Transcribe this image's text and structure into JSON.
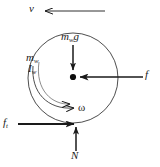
{
  "figure": {
    "stroke_color": "#1a1a1a",
    "background_color": "#ffffff"
  },
  "wheel": {
    "name": "wheel-circle",
    "center_x": 73,
    "center_y": 78,
    "radius": 45,
    "hub_label": "center-of-mass-dot"
  },
  "labels": {
    "velocity": {
      "symbol": "v",
      "subscript": ""
    },
    "weight": {
      "symbol": "m",
      "subscript": "w",
      "trailing": "g"
    },
    "mass": {
      "symbol": "m",
      "subscript": "w"
    },
    "inertia": {
      "symbol": "I",
      "subscript": "w"
    },
    "friction": {
      "symbol": "f",
      "subscript": ""
    },
    "angular_velocity": {
      "symbol": "ω",
      "subscript": ""
    },
    "traction": {
      "symbol": "f",
      "subscript": "t"
    },
    "normal": {
      "symbol": "N",
      "subscript": ""
    }
  },
  "vectors": [
    {
      "name": "velocity-arrow",
      "label": "v",
      "direction": "left",
      "from_x": 105,
      "from_y": 11,
      "to_x": 42,
      "to_y": 11
    },
    {
      "name": "weight-arrow",
      "label": "m_w g",
      "direction": "down",
      "from_x": 73,
      "from_y": 46,
      "to_x": 73,
      "to_y": 71
    },
    {
      "name": "friction-force-arrow",
      "label": "f",
      "direction": "left",
      "from_x": 143,
      "from_y": 77,
      "to_x": 81,
      "to_y": 77
    },
    {
      "name": "traction-force-arrow",
      "label": "f_t",
      "direction": "right",
      "from_x": 18,
      "from_y": 124,
      "to_x": 73,
      "to_y": 124
    },
    {
      "name": "normal-force-arrow",
      "label": "N",
      "direction": "up",
      "from_x": 76,
      "from_y": 150,
      "to_x": 76,
      "to_y": 126
    },
    {
      "name": "angular-velocity-arc-arrow",
      "label": "ω",
      "direction": "clockwise-arc",
      "arc_start_x": 33,
      "arc_start_y": 68,
      "arc_end_x": 76,
      "arc_end_y": 108
    }
  ]
}
